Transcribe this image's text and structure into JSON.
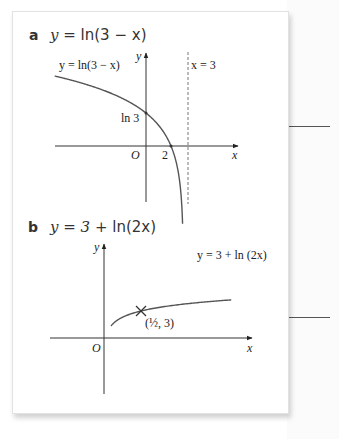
{
  "part_a": {
    "letter": "a",
    "heading_prefix": "y = ",
    "heading_func": "ln(3 − x)",
    "curve_label": "y = ln(3 − x)",
    "axis_y": "y",
    "axis_x": "x",
    "origin": "O",
    "y_intercept_label": "ln 3",
    "x_intercept_label": "2",
    "asymptote_label": "x = 3",
    "curve_color": "#555555",
    "asymptote_style": "dashed"
  },
  "part_b": {
    "letter": "b",
    "heading_prefix": "y = 3 + ",
    "heading_func": "ln(2x)",
    "curve_label": "y = 3 + ln (2x)",
    "axis_y": "y",
    "axis_x": "x",
    "origin": "O",
    "point_label": "(½, 3)",
    "point_marker": "cross",
    "curve_color": "#555555"
  },
  "chart_data": [
    {
      "type": "line",
      "title": "y = ln(3 − x)",
      "function": "ln(3 - x)",
      "xlabel": "x",
      "ylabel": "y",
      "annotations": [
        {
          "label": "ln 3",
          "x": 0,
          "y": 1.0986
        },
        {
          "label": "2",
          "x": 2,
          "y": 0
        },
        {
          "label": "x = 3",
          "type": "vertical-asymptote",
          "x": 3
        }
      ],
      "xlim": [
        -3.5,
        3.8
      ],
      "ylim": [
        -2.3,
        1.6
      ],
      "ticks": "none",
      "grid": false
    },
    {
      "type": "line",
      "title": "y = 3 + ln(2x)",
      "function": "3 + ln(2x)",
      "xlabel": "x",
      "ylabel": "y",
      "annotations": [
        {
          "label": "(1/2, 3)",
          "x": 0.5,
          "y": 3,
          "marker": "cross"
        }
      ],
      "xlim": [
        -0.9,
        2.5
      ],
      "ylim": [
        -2.0,
        5.1
      ],
      "ticks": "none",
      "grid": false
    }
  ]
}
